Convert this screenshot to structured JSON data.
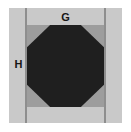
{
  "figure": {
    "name": "octagon-dimension-diagram",
    "type": "technical-drawing",
    "labels": {
      "top": "G",
      "left": "H"
    },
    "colors": {
      "background": "#ffffff",
      "outer_frame": "#c9c9c9",
      "divider": "#8e8e8e",
      "inner_plate": "#9d9d9d",
      "octagon": "#1f1f1f"
    },
    "shape": {
      "name": "octagon",
      "sides": 8
    }
  }
}
